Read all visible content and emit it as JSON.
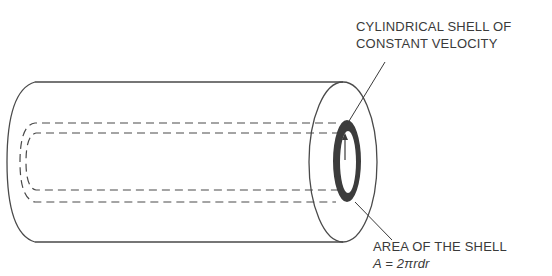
{
  "diagram": {
    "labels": {
      "top_line1": "CYLINDRICAL SHELL OF",
      "top_line2": "CONSTANT VELOCITY",
      "bottom_line1": "AREA OF THE SHELL",
      "bottom_formula": "A = 2πrdr"
    },
    "colors": {
      "stroke": "#4a4a4a",
      "shell_fill": "#3c3c3c",
      "background": "#ffffff"
    }
  }
}
